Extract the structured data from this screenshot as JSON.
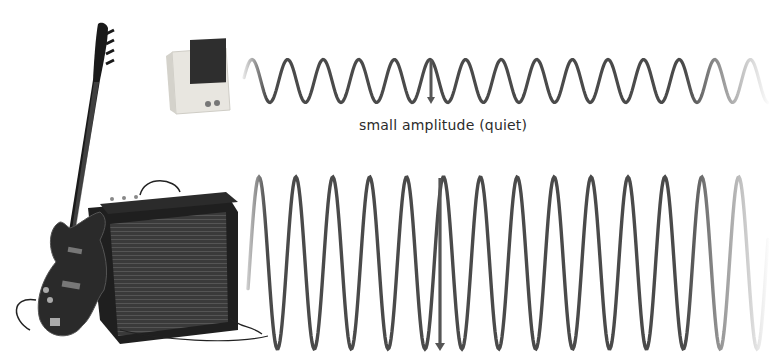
{
  "figure": {
    "caption_small": "small amplitude (quiet)"
  },
  "illustrations": {
    "small_source": "small-speaker",
    "large_source": "bass-guitar-and-amplifier"
  },
  "waves": [
    {
      "id": "small",
      "label": "small amplitude (quiet)",
      "relative_amplitude": 0.25,
      "cycles": 14,
      "color": "#4a4a4a"
    },
    {
      "id": "large",
      "label": "",
      "relative_amplitude": 1.0,
      "cycles": 14,
      "color": "#4a4a4a"
    }
  ],
  "colors": {
    "wave": "#4a4a4a",
    "arrow": "#555555",
    "text": "#2b2b2b",
    "speaker_body": "#e8e6e0",
    "speaker_grille": "#2e2e2e",
    "amp_body": "#1f1f1f",
    "amp_grille": "#3a3a3a",
    "guitar_body": "#2a2a2a"
  }
}
